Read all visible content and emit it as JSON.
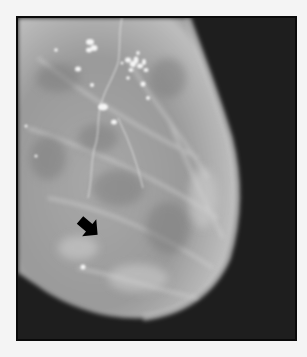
{
  "figure": {
    "type": "mammogram",
    "background_color": "#f4f4f4",
    "frame_color": "#0a0a0a",
    "film_background_color": "#1c1c1c",
    "tissue_color": "#b4b4b4",
    "calcification_color": "#f2f2f2",
    "annotation": {
      "type": "arrow",
      "color": "#000000",
      "direction": "down-right"
    },
    "top_caption_cropped": ""
  }
}
